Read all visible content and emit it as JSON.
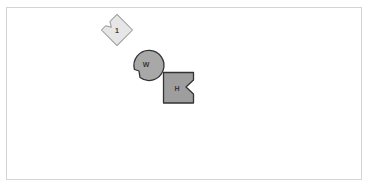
{
  "canvas": {
    "width": 367,
    "height": 186,
    "background": "#ffffff",
    "frame_border": "#d4d4d4"
  },
  "pieces": [
    {
      "id": "piece-1",
      "label": "1",
      "shape": "rotated-square-with-notch",
      "fill": "#e6e6e6",
      "stroke": "#9a9a9a",
      "center": [
        117,
        30
      ]
    },
    {
      "id": "piece-w",
      "label": "W",
      "shape": "circle-with-notch",
      "fill": "#a8a8a8",
      "stroke": "#333333",
      "center": [
        146,
        64
      ]
    },
    {
      "id": "piece-h",
      "label": "H",
      "shape": "square-with-notch",
      "fill": "#9e9e9e",
      "stroke": "#333333",
      "center": [
        178,
        88
      ]
    }
  ]
}
